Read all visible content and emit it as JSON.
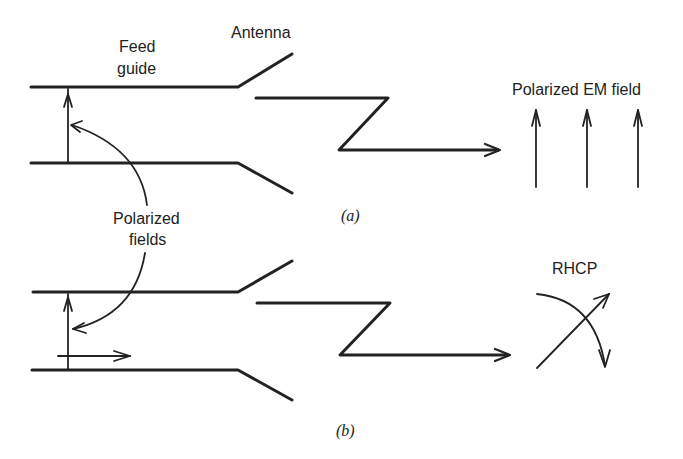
{
  "figure": {
    "part_a": {
      "caption": "(a)",
      "labels": {
        "antenna": "Antenna",
        "feed_guide_line1": "Feed",
        "feed_guide_line2": "guide",
        "em_field": "Polarized EM field"
      },
      "field_arrow_count": 3
    },
    "shared": {
      "polarized_fields_line1": "Polarized",
      "polarized_fields_line2": "fields"
    },
    "part_b": {
      "caption": "(b)",
      "labels": {
        "rhcp": "RHCP"
      }
    }
  }
}
